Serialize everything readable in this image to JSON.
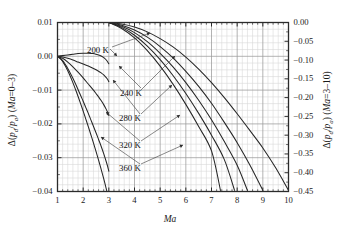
{
  "chart_data": {
    "type": "line",
    "title": "",
    "xlabel": "Ma",
    "ylabel_left": "Δ(p_d/p_a) (Ma=0–3)",
    "ylabel_right": "Δ(p_d/p_a) (Ma=3–10)",
    "xlim": [
      1,
      10
    ],
    "ylim_left": [
      -0.04,
      0.01
    ],
    "ylim_right": [
      -0.45,
      0.0
    ],
    "grid": true,
    "legend_position": "inline-annotations",
    "xticks": [
      1,
      2,
      3,
      4,
      5,
      6,
      7,
      8,
      9,
      10
    ],
    "xtick_labels": [
      "1",
      "2",
      "3",
      "4",
      "5",
      "6",
      "7",
      "8",
      "9",
      "10"
    ],
    "yticks_left": [
      0.01,
      0.0,
      -0.01,
      -0.02,
      -0.03,
      -0.04
    ],
    "ytick_labels_left": [
      "0.01",
      "0.00",
      "−0.01",
      "−0.02",
      "−0.03",
      "−0.04"
    ],
    "yticks_right": [
      0.0,
      -0.05,
      -0.1,
      -0.15,
      -0.2,
      -0.25,
      -0.3,
      -0.35,
      -0.4,
      -0.45
    ],
    "ytick_labels_right": [
      "0.00",
      "−0.05",
      "−0.10",
      "−0.15",
      "−0.20",
      "−0.25",
      "−0.30",
      "−0.35",
      "−0.40",
      "−0.45"
    ],
    "annotations": [
      {
        "label": "200 K",
        "x_px": 87,
        "y_px": 45
      },
      {
        "label": "240 K",
        "x_px": 120,
        "y_px": 88
      },
      {
        "label": "280 K",
        "x_px": 119,
        "y_px": 113
      },
      {
        "label": "320 K",
        "x_px": 119,
        "y_px": 140
      },
      {
        "label": "360 K",
        "x_px": 119,
        "y_px": 163
      }
    ],
    "series": [
      {
        "name": "200 K",
        "axis": "left",
        "x": [
          1.0,
          1.2,
          1.4,
          1.6,
          1.8,
          2.0,
          2.2,
          2.4,
          2.5,
          2.6,
          2.7,
          2.8,
          2.85,
          2.9,
          2.95,
          3.0
        ],
        "values": [
          0.0,
          0.0002,
          0.0004,
          0.0006,
          0.0008,
          0.0009,
          0.0009,
          0.0008,
          0.0006,
          0.0004,
          0.0001,
          -0.0004,
          -0.0007,
          -0.0011,
          -0.0016,
          -0.0022
        ]
      },
      {
        "name": "240 K",
        "axis": "left",
        "x": [
          1.0,
          1.2,
          1.4,
          1.6,
          1.8,
          2.0,
          2.2,
          2.4,
          2.6,
          2.7,
          2.8,
          2.9,
          2.95,
          3.0
        ],
        "values": [
          0.0,
          -0.0002,
          -0.0006,
          -0.0011,
          -0.0017,
          -0.0023,
          -0.0029,
          -0.0036,
          -0.0044,
          -0.0049,
          -0.0055,
          -0.0063,
          -0.0068,
          -0.0075
        ]
      },
      {
        "name": "280 K",
        "axis": "left",
        "x": [
          1.0,
          1.2,
          1.4,
          1.6,
          1.8,
          2.0,
          2.2,
          2.4,
          2.5,
          2.6,
          2.7,
          2.8,
          2.9,
          2.95,
          3.0
        ],
        "values": [
          0.0,
          -0.0006,
          -0.0017,
          -0.0031,
          -0.0047,
          -0.0064,
          -0.0082,
          -0.01,
          -0.011,
          -0.012,
          -0.0131,
          -0.0143,
          -0.0157,
          -0.0165,
          -0.0175
        ]
      },
      {
        "name": "320 K",
        "axis": "left",
        "x": [
          1.0,
          1.2,
          1.4,
          1.6,
          1.8,
          2.0,
          2.1,
          2.2,
          2.3,
          2.4,
          2.5,
          2.6,
          2.7,
          2.8,
          2.9,
          2.95,
          3.0
        ],
        "values": [
          0.0,
          -0.0013,
          -0.0036,
          -0.0065,
          -0.0098,
          -0.0133,
          -0.0151,
          -0.0169,
          -0.0188,
          -0.0207,
          -0.0226,
          -0.0246,
          -0.0266,
          -0.0288,
          -0.0312,
          -0.0325,
          -0.034
        ]
      },
      {
        "name": "360 K",
        "axis": "left",
        "x": [
          1.0,
          1.15,
          1.3,
          1.45,
          1.6,
          1.75,
          1.9,
          2.0,
          2.1,
          2.2,
          2.3,
          2.4,
          2.5,
          2.6,
          2.7,
          2.8,
          2.9,
          2.95,
          3.0
        ],
        "values": [
          0.0,
          -0.001,
          -0.0028,
          -0.0051,
          -0.0078,
          -0.0108,
          -0.014,
          -0.0162,
          -0.0185,
          -0.0208,
          -0.0232,
          -0.0256,
          -0.0281,
          -0.0307,
          -0.0334,
          -0.0362,
          -0.0392,
          -0.0408,
          -0.0425
        ]
      },
      {
        "name": "200 K",
        "axis": "right",
        "x": [
          3.0,
          3.5,
          4.0,
          4.5,
          5.0,
          5.5,
          6.0,
          6.5,
          7.0,
          7.5,
          8.0,
          8.5,
          9.0,
          9.5,
          10.0
        ],
        "values": [
          0.0,
          -0.004,
          -0.012,
          -0.025,
          -0.043,
          -0.065,
          -0.092,
          -0.124,
          -0.16,
          -0.2,
          -0.243,
          -0.288,
          -0.334,
          -0.387,
          -0.447
        ]
      },
      {
        "name": "240 K",
        "axis": "right",
        "x": [
          3.0,
          3.5,
          4.0,
          4.5,
          5.0,
          5.5,
          6.0,
          6.5,
          7.0,
          7.5,
          8.0,
          8.5,
          9.0
        ],
        "values": [
          0.0,
          -0.007,
          -0.02,
          -0.039,
          -0.064,
          -0.094,
          -0.13,
          -0.17,
          -0.215,
          -0.266,
          -0.32,
          -0.38,
          -0.447
        ]
      },
      {
        "name": "280 K",
        "axis": "right",
        "x": [
          3.0,
          3.5,
          4.0,
          4.5,
          5.0,
          5.5,
          6.0,
          6.5,
          7.0,
          7.5,
          8.0,
          8.4
        ],
        "values": [
          0.0,
          -0.01,
          -0.027,
          -0.051,
          -0.082,
          -0.118,
          -0.16,
          -0.207,
          -0.259,
          -0.317,
          -0.38,
          -0.447
        ]
      },
      {
        "name": "320 K",
        "axis": "right",
        "x": [
          3.0,
          3.5,
          4.0,
          4.5,
          5.0,
          5.5,
          6.0,
          6.5,
          7.0,
          7.5,
          7.9
        ],
        "values": [
          0.0,
          -0.013,
          -0.034,
          -0.063,
          -0.099,
          -0.141,
          -0.189,
          -0.242,
          -0.3,
          -0.365,
          -0.447
        ]
      },
      {
        "name": "360 K",
        "axis": "right",
        "x": [
          3.0,
          3.5,
          4.0,
          4.5,
          5.0,
          5.5,
          6.0,
          6.5,
          7.0,
          7.35
        ],
        "values": [
          0.0,
          -0.016,
          -0.041,
          -0.075,
          -0.116,
          -0.164,
          -0.218,
          -0.277,
          -0.342,
          -0.447
        ]
      }
    ]
  },
  "style": {
    "axis_color": "#2b2b2b",
    "grid_major_color": "#9a9a9a",
    "grid_minor_color": "#d8d8d8",
    "curve_color": "#262626",
    "background": "#ffffff"
  }
}
